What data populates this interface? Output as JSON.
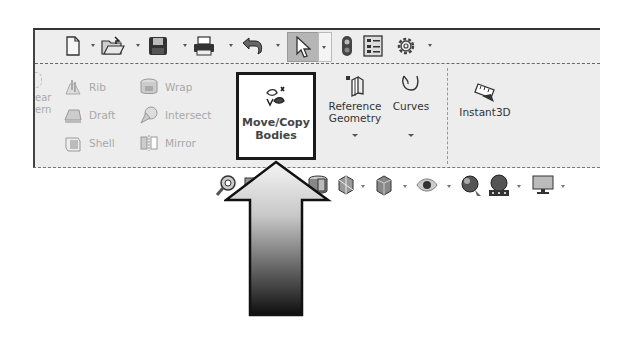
{
  "quick_access": {
    "items": [
      {
        "name": "new-document",
        "icon": "new-document-icon",
        "has_dropdown": true
      },
      {
        "name": "open",
        "icon": "open-folder-icon",
        "has_dropdown": true
      },
      {
        "name": "save",
        "icon": "save-icon",
        "has_dropdown": true
      },
      {
        "name": "print",
        "icon": "print-icon",
        "has_dropdown": true
      },
      {
        "name": "undo",
        "icon": "undo-icon",
        "has_dropdown": true
      },
      {
        "name": "select",
        "icon": "select-cursor-icon",
        "has_dropdown": true,
        "active": true
      },
      {
        "name": "rebuild",
        "icon": "traffic-light-icon",
        "has_dropdown": false
      },
      {
        "name": "file-properties",
        "icon": "file-properties-icon",
        "has_dropdown": false
      },
      {
        "name": "options",
        "icon": "gear-icon",
        "has_dropdown": true
      }
    ]
  },
  "ribbon": {
    "partial_left_label_line1": "ear",
    "partial_left_label_line2": "ern",
    "small_buttons": [
      {
        "label": "Rib",
        "icon": "rib-icon"
      },
      {
        "label": "Draft",
        "icon": "draft-icon"
      },
      {
        "label": "Shell",
        "icon": "shell-icon"
      },
      {
        "label": "Wrap",
        "icon": "wrap-icon"
      },
      {
        "label": "Intersect",
        "icon": "intersect-icon"
      },
      {
        "label": "Mirror",
        "icon": "mirror-icon"
      }
    ],
    "highlighted": {
      "label_line1": "Move/Copy",
      "label_line2": "Bodies",
      "icon": "move-copy-bodies-icon"
    },
    "large_buttons": [
      {
        "label_line1": "Reference",
        "label_line2": "Geometry",
        "icon": "reference-geometry-icon",
        "has_dropdown": true
      },
      {
        "label_line1": "Curves",
        "label_line2": "",
        "icon": "curves-icon",
        "has_dropdown": true
      },
      {
        "label_line1": "Instant3D",
        "label_line2": "",
        "icon": "instant3d-icon",
        "has_dropdown": false
      }
    ]
  },
  "view_toolbar": {
    "items": [
      {
        "icon": "zoom-to-area-icon"
      },
      {
        "icon": "previous-view-icon"
      },
      {
        "icon": "section-view-icon"
      },
      {
        "icon": "view-orientation-icon",
        "has_dropdown": true
      },
      {
        "icon": "display-style-icon",
        "has_dropdown": true
      },
      {
        "icon": "hide-show-items-icon",
        "has_dropdown": true
      },
      {
        "icon": "edit-appearance-icon"
      },
      {
        "icon": "apply-scene-icon",
        "has_dropdown": true
      },
      {
        "icon": "view-settings-icon",
        "has_dropdown": true
      }
    ]
  },
  "annotation": {
    "type": "callout-arrow",
    "target": "Move/Copy Bodies",
    "gradient_top": "#f2f2f2",
    "gradient_bottom": "#111111"
  }
}
